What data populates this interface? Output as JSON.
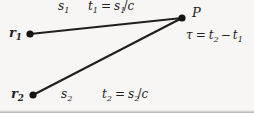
{
  "figure": {
    "background_color": "#f7f6f4",
    "stroke_color": "#1f1f1f",
    "type": "physics-ray-path-diagram"
  },
  "points": [
    {
      "id": "r1",
      "label_base": "r",
      "label_sub": "1",
      "x": 30,
      "y": 34,
      "dot_radius": 3.6
    },
    {
      "id": "r2",
      "label_base": "r",
      "label_sub": "2",
      "x": 33,
      "y": 95,
      "dot_radius": 3.6
    },
    {
      "id": "P",
      "label_base": "P",
      "label_sub": "",
      "x": 182,
      "y": 18,
      "dot_radius": 3.6
    }
  ],
  "paths": [
    {
      "id": "path-r1-P",
      "from": "r1",
      "to": "P",
      "x1": 30,
      "y1": 34,
      "x2": 182,
      "y2": 18
    },
    {
      "id": "path-r2-P",
      "from": "r2",
      "to": "P",
      "x1": 33,
      "y1": 95,
      "x2": 182,
      "y2": 18
    }
  ],
  "labels": {
    "r1": {
      "base": "r",
      "sub": "1"
    },
    "r2": {
      "base": "r",
      "sub": "2"
    },
    "P": {
      "text": "P"
    },
    "s1": {
      "base": "s",
      "sub": "1"
    },
    "s2": {
      "base": "s",
      "sub": "2"
    },
    "t1_eq": {
      "lhs_base": "t",
      "lhs_sub": "1",
      "eq": "=",
      "rhs_base": "s",
      "rhs_sub": "1",
      "slash": "/",
      "denom": "c"
    },
    "t2_eq": {
      "lhs_base": "t",
      "lhs_sub": "2",
      "eq": "=",
      "rhs_base": "s",
      "rhs_sub": "2",
      "slash": "/",
      "denom": "c"
    },
    "tau_eq": {
      "lhs": "τ",
      "eq": "=",
      "term1_base": "t",
      "term1_sub": "2",
      "minus": "−",
      "term2_base": "t",
      "term2_sub": "1"
    }
  }
}
